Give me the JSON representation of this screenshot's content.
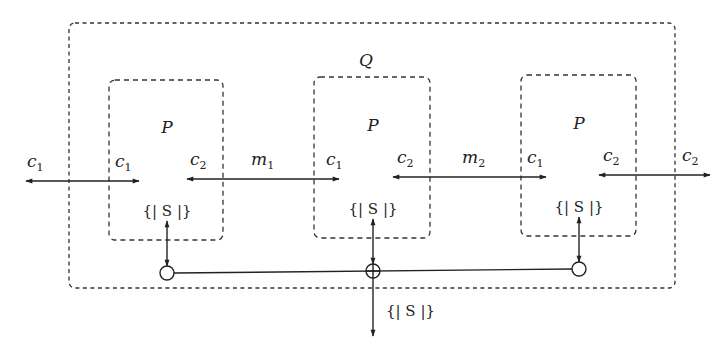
{
  "diagram": {
    "outer_process": {
      "label": "Q"
    },
    "processes": [
      {
        "label": "P",
        "left_channel": "c",
        "left_sub": "1",
        "right_channel": "c",
        "right_sub": "2",
        "state": "{| S |}"
      },
      {
        "label": "P",
        "left_channel": "c",
        "left_sub": "1",
        "right_channel": "c",
        "right_sub": "2",
        "state": "{| S |}"
      },
      {
        "label": "P",
        "left_channel": "c",
        "left_sub": "1",
        "right_channel": "c",
        "right_sub": "2",
        "state": "{| S |}"
      }
    ],
    "links": [
      {
        "name": "m",
        "sub": "1"
      },
      {
        "name": "m",
        "sub": "2"
      }
    ],
    "external": {
      "left_channel": "c",
      "left_sub": "1",
      "right_channel": "c",
      "right_sub": "2",
      "shared_state": "{| S |}"
    },
    "colors": {
      "stroke": "#222222",
      "background": "#ffffff"
    }
  }
}
